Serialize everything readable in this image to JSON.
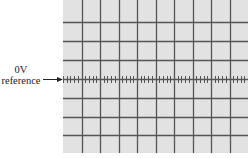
{
  "diagram": {
    "reference_label": {
      "line1": "0V",
      "line2": "reference"
    },
    "graticule": {
      "horizontal_divisions": 10,
      "vertical_divisions": 8,
      "minor_ticks_per_division": 5,
      "background_color": "#e2e2e2",
      "grid_color": "#555555",
      "label_color": "#222222"
    }
  }
}
